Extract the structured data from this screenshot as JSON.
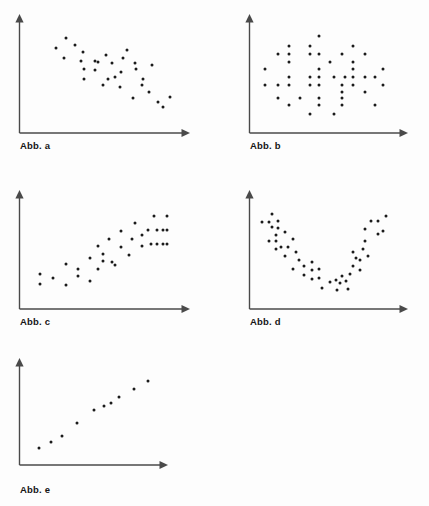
{
  "figure": {
    "background_color": "#fdfdfd",
    "axis_color": "#4a4a4a",
    "point_color": "#1b1b1b",
    "caption_color": "#161616"
  },
  "panels": [
    {
      "id": "a",
      "caption": "Abb. a",
      "left": 18,
      "top": 14,
      "plot_width": 172,
      "plot_height": 119,
      "caption_left": 20,
      "caption_top": 140
    },
    {
      "id": "b",
      "caption": "Abb. b",
      "left": 248,
      "top": 14,
      "plot_width": 160,
      "plot_height": 119,
      "caption_left": 250,
      "caption_top": 140
    },
    {
      "id": "c",
      "caption": "Abb. c",
      "left": 18,
      "top": 190,
      "plot_width": 172,
      "plot_height": 119,
      "caption_left": 20,
      "caption_top": 316
    },
    {
      "id": "d",
      "caption": "Abb. d",
      "left": 248,
      "top": 190,
      "plot_width": 160,
      "plot_height": 119,
      "caption_left": 250,
      "caption_top": 316
    },
    {
      "id": "e",
      "caption": "Abb. e",
      "left": 18,
      "top": 358,
      "plot_width": 150,
      "plot_height": 107,
      "caption_left": 20,
      "caption_top": 484
    }
  ],
  "chart_data": [
    {
      "type": "scatter",
      "id": "a",
      "title": "Abb. a",
      "xlabel": "",
      "ylabel": "",
      "grid": false,
      "legend": "none",
      "xlim": [
        0,
        100
      ],
      "ylim": [
        0,
        100
      ],
      "relationship": "strong negative correlation",
      "points": [
        [
          26,
          86
        ],
        [
          19,
          77
        ],
        [
          32,
          80
        ],
        [
          37,
          73
        ],
        [
          24,
          67
        ],
        [
          36,
          64
        ],
        [
          38,
          56
        ],
        [
          45,
          64
        ],
        [
          47,
          63
        ],
        [
          45,
          55
        ],
        [
          38,
          47
        ],
        [
          54,
          47
        ],
        [
          57,
          62
        ],
        [
          64,
          67
        ],
        [
          63,
          53
        ],
        [
          67,
          75
        ],
        [
          72,
          62
        ],
        [
          73,
          56
        ],
        [
          78,
          47
        ],
        [
          84,
          60
        ],
        [
          51,
          41
        ],
        [
          62,
          39
        ],
        [
          77,
          41
        ],
        [
          82,
          34
        ],
        [
          71,
          28
        ],
        [
          88,
          24
        ],
        [
          96,
          29
        ],
        [
          91,
          19
        ],
        [
          53,
          70
        ],
        [
          59,
          49
        ]
      ]
    },
    {
      "type": "scatter",
      "id": "b",
      "title": "Abb. b",
      "xlabel": "",
      "ylabel": "",
      "grid": false,
      "legend": "none",
      "xlim": [
        0,
        100
      ],
      "ylim": [
        0,
        100
      ],
      "relationship": "no correlation, random cloud",
      "points": [
        [
          45,
          88
        ],
        [
          23,
          79
        ],
        [
          38,
          79
        ],
        [
          70,
          79
        ],
        [
          15,
          71
        ],
        [
          23,
          71
        ],
        [
          38,
          71
        ],
        [
          45,
          71
        ],
        [
          62,
          71
        ],
        [
          79,
          71
        ],
        [
          23,
          63
        ],
        [
          5,
          56
        ],
        [
          45,
          56
        ],
        [
          70,
          56
        ],
        [
          92,
          56
        ],
        [
          23,
          49
        ],
        [
          38,
          49
        ],
        [
          45,
          49
        ],
        [
          56,
          49
        ],
        [
          64,
          49
        ],
        [
          70,
          49
        ],
        [
          86,
          49
        ],
        [
          5,
          41
        ],
        [
          15,
          41
        ],
        [
          23,
          41
        ],
        [
          38,
          41
        ],
        [
          45,
          41
        ],
        [
          62,
          41
        ],
        [
          70,
          41
        ],
        [
          92,
          41
        ],
        [
          62,
          34
        ],
        [
          79,
          34
        ],
        [
          15,
          28
        ],
        [
          31,
          28
        ],
        [
          45,
          28
        ],
        [
          62,
          28
        ],
        [
          23,
          21
        ],
        [
          45,
          21
        ],
        [
          62,
          21
        ],
        [
          86,
          21
        ],
        [
          38,
          13
        ],
        [
          56,
          13
        ],
        [
          79,
          49
        ],
        [
          53,
          63
        ],
        [
          70,
          63
        ]
      ]
    },
    {
      "type": "scatter",
      "id": "c",
      "title": "Abb. c",
      "xlabel": "",
      "ylabel": "",
      "grid": false,
      "legend": "none",
      "xlim": [
        0,
        100
      ],
      "ylim": [
        0,
        100
      ],
      "relationship": "strong positive correlation",
      "points": [
        [
          8,
          28
        ],
        [
          8,
          18
        ],
        [
          17,
          24
        ],
        [
          26,
          17
        ],
        [
          26,
          38
        ],
        [
          34,
          26
        ],
        [
          34,
          33
        ],
        [
          42,
          21
        ],
        [
          42,
          44
        ],
        [
          47,
          33
        ],
        [
          47,
          55
        ],
        [
          51,
          41
        ],
        [
          51,
          48
        ],
        [
          55,
          62
        ],
        [
          57,
          40
        ],
        [
          59,
          37
        ],
        [
          63,
          54
        ],
        [
          63,
          70
        ],
        [
          68,
          47
        ],
        [
          70,
          62
        ],
        [
          72,
          78
        ],
        [
          77,
          66
        ],
        [
          77,
          55
        ],
        [
          81,
          71
        ],
        [
          83,
          57
        ],
        [
          85,
          84
        ],
        [
          87,
          71
        ],
        [
          87,
          57
        ],
        [
          91,
          71
        ],
        [
          91,
          57
        ],
        [
          94,
          84
        ],
        [
          94,
          71
        ],
        [
          94,
          57
        ]
      ]
    },
    {
      "type": "scatter",
      "id": "d",
      "title": "Abb. d",
      "xlabel": "",
      "ylabel": "",
      "grid": false,
      "legend": "none",
      "xlim": [
        0,
        100
      ],
      "ylim": [
        0,
        100
      ],
      "relationship": "U-shaped quadratic, non-linear",
      "points": [
        [
          3,
          79
        ],
        [
          8,
          79
        ],
        [
          10,
          86
        ],
        [
          10,
          74
        ],
        [
          15,
          80
        ],
        [
          15,
          73
        ],
        [
          13,
          66
        ],
        [
          13,
          60
        ],
        [
          20,
          69
        ],
        [
          8,
          60
        ],
        [
          17,
          54
        ],
        [
          22,
          54
        ],
        [
          26,
          62
        ],
        [
          13,
          52
        ],
        [
          20,
          46
        ],
        [
          28,
          50
        ],
        [
          30,
          42
        ],
        [
          34,
          36
        ],
        [
          26,
          33
        ],
        [
          34,
          27
        ],
        [
          40,
          40
        ],
        [
          40,
          32
        ],
        [
          40,
          23
        ],
        [
          45,
          33
        ],
        [
          45,
          24
        ],
        [
          47,
          15
        ],
        [
          53,
          20
        ],
        [
          57,
          22
        ],
        [
          60,
          19
        ],
        [
          62,
          26
        ],
        [
          65,
          21
        ],
        [
          68,
          28
        ],
        [
          70,
          36
        ],
        [
          72,
          44
        ],
        [
          70,
          50
        ],
        [
          75,
          32
        ],
        [
          75,
          42
        ],
        [
          77,
          52
        ],
        [
          79,
          60
        ],
        [
          81,
          46
        ],
        [
          79,
          72
        ],
        [
          83,
          80
        ],
        [
          88,
          80
        ],
        [
          88,
          67
        ],
        [
          92,
          70
        ],
        [
          94,
          84
        ],
        [
          66,
          14
        ],
        [
          58,
          13
        ]
      ]
    },
    {
      "type": "scatter",
      "id": "e",
      "title": "Abb. e",
      "xlabel": "",
      "ylabel": "",
      "grid": false,
      "legend": "none",
      "xlim": [
        0,
        100
      ],
      "ylim": [
        0,
        100
      ],
      "relationship": "near-perfect positive linear relationship, few points",
      "points": [
        [
          9,
          12
        ],
        [
          18,
          19
        ],
        [
          27,
          25
        ],
        [
          39,
          40
        ],
        [
          52,
          54
        ],
        [
          60,
          58
        ],
        [
          66,
          62
        ],
        [
          72,
          68
        ],
        [
          84,
          77
        ],
        [
          95,
          86
        ]
      ]
    }
  ]
}
